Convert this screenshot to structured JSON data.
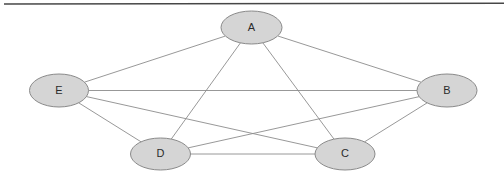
{
  "figure": {
    "kind": "graph-diagram",
    "title": "",
    "background_color": "#ffffff",
    "top_rule": {
      "name": "top-rule",
      "color": "#474747",
      "x1": 4,
      "y1": 4,
      "x2": 504,
      "y2": 3.2,
      "thickness": 1.6
    }
  },
  "style": {
    "node_fill": "#d5d5d5",
    "node_stroke": "#8a8a8a",
    "node_stroke_width": 1,
    "edge_stroke": "#8c8c8c",
    "edge_stroke_width": 0.9,
    "label_color": "#2b2b2b",
    "label_font_size": 11
  },
  "graph_data": {
    "type": "graph",
    "directed": false,
    "node_count": 5,
    "edge_count": 10,
    "complete": true,
    "description": "Complete graph K5 on five vertices A, B, C, D, E",
    "nodes": [
      {
        "id": "A",
        "label": "A",
        "cx": 251.5,
        "cy": 27.5,
        "rx": 30.5,
        "ry": 16.5
      },
      {
        "id": "B",
        "label": "B",
        "cx": 447.0,
        "cy": 90.5,
        "rx": 30.0,
        "ry": 16.5
      },
      {
        "id": "C",
        "label": "C",
        "cx": 345.0,
        "cy": 154.0,
        "rx": 30.0,
        "ry": 16.0
      },
      {
        "id": "D",
        "label": "D",
        "cx": 160.5,
        "cy": 154.0,
        "rx": 30.0,
        "ry": 16.0
      },
      {
        "id": "E",
        "label": "E",
        "cx": 59.0,
        "cy": 90.5,
        "rx": 29.5,
        "ry": 16.5
      }
    ],
    "edges": [
      {
        "id": "E-A",
        "source": "E",
        "target": "A",
        "label": ""
      },
      {
        "id": "E-B",
        "source": "E",
        "target": "B",
        "label": ""
      },
      {
        "id": "E-C",
        "source": "E",
        "target": "C",
        "label": ""
      },
      {
        "id": "E-D",
        "source": "E",
        "target": "D",
        "label": ""
      },
      {
        "id": "A-B",
        "source": "A",
        "target": "B",
        "label": ""
      },
      {
        "id": "A-C",
        "source": "A",
        "target": "C",
        "label": ""
      },
      {
        "id": "A-D",
        "source": "A",
        "target": "D",
        "label": ""
      },
      {
        "id": "B-C",
        "source": "B",
        "target": "C",
        "label": ""
      },
      {
        "id": "B-D",
        "source": "B",
        "target": "D",
        "label": ""
      },
      {
        "id": "D-C",
        "source": "D",
        "target": "C",
        "label": ""
      }
    ]
  }
}
